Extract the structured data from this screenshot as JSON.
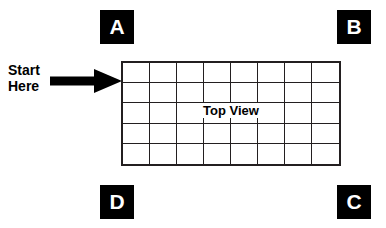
{
  "diagram": {
    "background_color": "#ffffff",
    "ink_color": "#231f20",
    "corner_labels": [
      {
        "id": "a",
        "text": "A",
        "position": "top-left"
      },
      {
        "id": "b",
        "text": "B",
        "position": "top-right"
      },
      {
        "id": "c",
        "text": "C",
        "position": "bottom-right"
      },
      {
        "id": "d",
        "text": "D",
        "position": "bottom-left"
      }
    ],
    "start_marker": {
      "label": "Start\nHere",
      "line1": "Start",
      "line2": "Here",
      "icon": "arrow-right-icon",
      "points_to": "grid-left-edge"
    },
    "grid": {
      "caption": "Top View",
      "columns": 8,
      "rows": 5,
      "cell_count": 40,
      "border_color": "#231f20"
    }
  }
}
